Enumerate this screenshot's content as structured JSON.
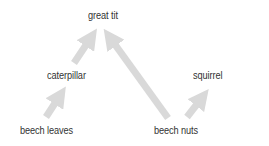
{
  "diagram": {
    "type": "food-web",
    "arrow_color": "#d9d9d9",
    "text_color": "#333333",
    "nodes": [
      {
        "id": "great-tit",
        "label": "great tit"
      },
      {
        "id": "caterpillar",
        "label": "caterpillar"
      },
      {
        "id": "squirrel",
        "label": "squirrel"
      },
      {
        "id": "beech-leaves",
        "label": "beech leaves"
      },
      {
        "id": "beech-nuts",
        "label": "beech nuts"
      }
    ],
    "edges": [
      {
        "from": "beech leaves",
        "to": "caterpillar"
      },
      {
        "from": "caterpillar",
        "to": "great tit"
      },
      {
        "from": "beech nuts",
        "to": "great tit"
      },
      {
        "from": "beech nuts",
        "to": "squirrel"
      }
    ]
  }
}
